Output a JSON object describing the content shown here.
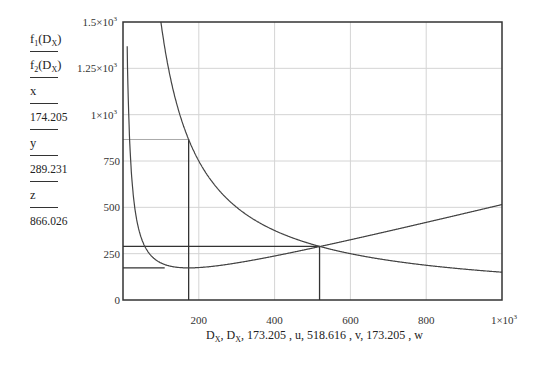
{
  "sidebar": {
    "items": [
      {
        "label": "f1(Dx)",
        "main": "f",
        "sub": "1",
        "arg_main": "D",
        "arg_sub": "X"
      },
      {
        "label": "f2(Dx)",
        "main": "f",
        "sub": "2",
        "arg_main": "D",
        "arg_sub": "X"
      },
      {
        "label": "x"
      },
      {
        "label": "174.205"
      },
      {
        "label": "y"
      },
      {
        "label": "289.231"
      },
      {
        "label": "z"
      },
      {
        "label": "866.026"
      }
    ]
  },
  "chart_data": {
    "type": "line",
    "title": "",
    "xlabel": "Dx, Dx, 173.205 , u, 518.616 , v, 173.205 , w",
    "ylabel": "f1(Dx) f2(Dx) x 174.205 y 289.231 z 866.026",
    "xlim": [
      0,
      1000
    ],
    "ylim": [
      0,
      1500
    ],
    "grid": true,
    "x_ticks": [
      "200",
      "400",
      "600",
      "800",
      "1×10³"
    ],
    "y_ticks": [
      "0",
      "250",
      "500",
      "750",
      "1×10³",
      "1.25×10³",
      "1.5×10³"
    ],
    "series": [
      {
        "name": "f1(Dx)",
        "formula": "D/2 + 15000/D",
        "x": [
          10,
          20,
          50,
          100,
          173.2,
          300,
          518.6,
          700,
          1000
        ],
        "values": [
          1505,
          760,
          325,
          200,
          173.2,
          200,
          288.2,
          371.4,
          515
        ]
      },
      {
        "name": "f2(Dx)",
        "formula": "150000/D",
        "x": [
          100,
          173.2,
          300,
          518.6,
          700,
          1000
        ],
        "values": [
          1500,
          866,
          500,
          289.2,
          214.3,
          150
        ]
      }
    ],
    "markers": {
      "vertical_lines": [
        173.205,
        518.616
      ],
      "horizontal_lines": [
        {
          "y": 173.205,
          "to_x": 110
        },
        {
          "y": 289.231,
          "to_x": 518.616
        },
        {
          "y": 866.026,
          "to_x": 173.205
        }
      ]
    },
    "annotations": {
      "x": 174.205,
      "y": 289.231,
      "z": 866.026
    }
  },
  "axis": {
    "x_label_parts": [
      "D",
      "X",
      ", ",
      "D",
      "X",
      ", 173.205 , u, 518.616 , v, 173.205 , w"
    ]
  }
}
